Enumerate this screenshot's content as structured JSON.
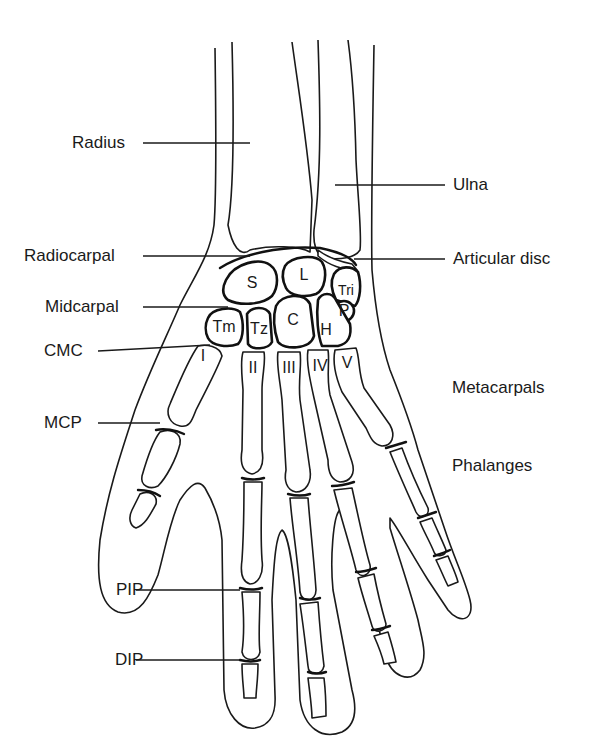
{
  "figure": {
    "left_labels": [
      {
        "id": "radius",
        "text": "Radius"
      },
      {
        "id": "radiocarpal",
        "text": "Radiocarpal"
      },
      {
        "id": "midcarpal",
        "text": "Midcarpal"
      },
      {
        "id": "cmc",
        "text": "CMC"
      },
      {
        "id": "mcp",
        "text": "MCP"
      },
      {
        "id": "pip",
        "text": "PIP"
      },
      {
        "id": "dip",
        "text": "DIP"
      }
    ],
    "right_labels": [
      {
        "id": "ulna",
        "text": "Ulna"
      },
      {
        "id": "articular_disc",
        "text": "Articular disc"
      },
      {
        "id": "metacarpals",
        "text": "Metacarpals"
      },
      {
        "id": "phalanges",
        "text": "Phalanges"
      }
    ],
    "carpal_bones": [
      {
        "abbr": "S",
        "name": "Scaphoid"
      },
      {
        "abbr": "L",
        "name": "Lunate"
      },
      {
        "abbr": "Tri",
        "name": "Triquetrum"
      },
      {
        "abbr": "P",
        "name": "Pisiform"
      },
      {
        "abbr": "Tm",
        "name": "Trapezium"
      },
      {
        "abbr": "Tz",
        "name": "Trapezoid"
      },
      {
        "abbr": "C",
        "name": "Capitate"
      },
      {
        "abbr": "H",
        "name": "Hamate"
      }
    ],
    "metacarpal_numerals": [
      "I",
      "II",
      "III",
      "IV",
      "V"
    ]
  }
}
